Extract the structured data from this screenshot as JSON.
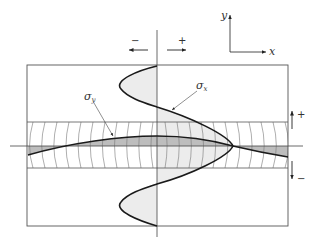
{
  "figure": {
    "type": "stress distribution diagram",
    "axes_icon": {
      "x_label": "x",
      "y_label": "y"
    },
    "top_signs": {
      "negative": "−",
      "positive": "+"
    },
    "side_signs": {
      "positive": "+",
      "negative": "−"
    },
    "curves": [
      {
        "id": "sigma_x",
        "symbol": "σ",
        "subscript": "x"
      },
      {
        "id": "sigma_y",
        "symbol": "σ",
        "subscript": "y"
      }
    ],
    "colors": {
      "line": "#222222",
      "thin_line": "#555555",
      "shade_light": "#e6e6e6",
      "shade_dark": "#bdbdbd"
    }
  }
}
